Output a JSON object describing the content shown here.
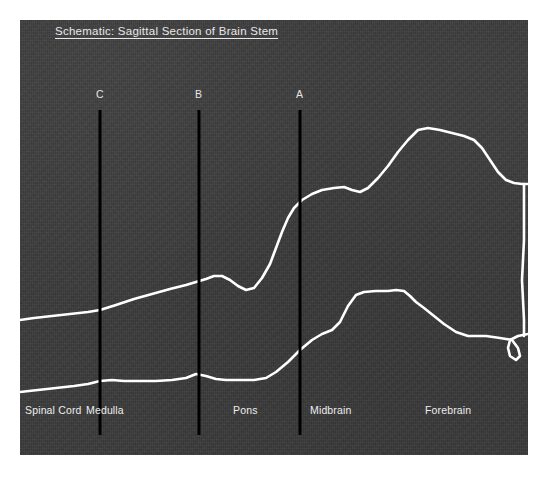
{
  "figure": {
    "title": "Schematic: Sagittal Section of Brain Stem",
    "background_color": "#ffffff",
    "plate_color": "#3b3b3b",
    "contour_color": "#ffffff",
    "marker_color": "#000000",
    "text_color": "#ededed"
  },
  "markers": [
    {
      "id": "marker-c",
      "label": "C",
      "x": 100,
      "label_x": 96,
      "label_y": 88,
      "y_top": 110,
      "y_bottom": 435
    },
    {
      "id": "marker-b",
      "label": "B",
      "x": 199,
      "label_x": 195,
      "label_y": 88,
      "y_top": 110,
      "y_bottom": 435
    },
    {
      "id": "marker-a",
      "label": "A",
      "x": 300,
      "label_x": 296,
      "label_y": 88,
      "y_top": 110,
      "y_bottom": 435
    }
  ],
  "region_labels": [
    {
      "id": "label-spinal-cord",
      "label": "Spinal Cord",
      "x": 25,
      "y": 404
    },
    {
      "id": "label-medulla",
      "label": "Medulla",
      "x": 86,
      "y": 404
    },
    {
      "id": "label-pons",
      "label": "Pons",
      "x": 233,
      "y": 404
    },
    {
      "id": "label-midbrain",
      "label": "Midbrain",
      "x": 310,
      "y": 404
    },
    {
      "id": "label-forebrain",
      "label": "Forebrain",
      "x": 425,
      "y": 404
    }
  ],
  "chart_data": {
    "type": "line",
    "title": "Schematic: Sagittal Section of Brain Stem",
    "xlabel": "",
    "ylabel": "",
    "grid": false,
    "legend": "none",
    "xlim": [
      20,
      528
    ],
    "ylim": [
      20,
      455
    ],
    "note": "Two white outline traces of a sagittal brain-stem profile drawn on a dark plate; y increases downward in screen pixels.",
    "series": [
      {
        "name": "dorsal-contour",
        "color": "#ffffff",
        "points": [
          [
            20,
            320
          ],
          [
            34,
            318
          ],
          [
            52,
            316
          ],
          [
            70,
            314
          ],
          [
            88,
            312
          ],
          [
            100,
            310
          ],
          [
            116,
            305
          ],
          [
            134,
            299
          ],
          [
            152,
            294
          ],
          [
            170,
            289
          ],
          [
            186,
            285
          ],
          [
            196,
            282
          ],
          [
            206,
            279
          ],
          [
            214,
            276
          ],
          [
            222,
            276
          ],
          [
            230,
            280
          ],
          [
            238,
            286
          ],
          [
            246,
            290
          ],
          [
            254,
            288
          ],
          [
            262,
            278
          ],
          [
            270,
            264
          ],
          [
            276,
            248
          ],
          [
            282,
            232
          ],
          [
            288,
            218
          ],
          [
            294,
            208
          ],
          [
            302,
            200
          ],
          [
            312,
            194
          ],
          [
            322,
            190
          ],
          [
            334,
            188
          ],
          [
            344,
            187
          ],
          [
            352,
            190
          ],
          [
            360,
            192
          ],
          [
            368,
            188
          ],
          [
            378,
            178
          ],
          [
            388,
            166
          ],
          [
            398,
            152
          ],
          [
            408,
            140
          ],
          [
            418,
            130
          ],
          [
            428,
            128
          ],
          [
            440,
            130
          ],
          [
            452,
            133
          ],
          [
            464,
            136
          ],
          [
            474,
            140
          ],
          [
            482,
            148
          ],
          [
            490,
            160
          ],
          [
            498,
            172
          ],
          [
            506,
            180
          ],
          [
            514,
            183
          ],
          [
            522,
            184
          ],
          [
            528,
            184
          ]
        ]
      },
      {
        "name": "ventral-contour",
        "color": "#ffffff",
        "points": [
          [
            20,
            392
          ],
          [
            38,
            390
          ],
          [
            56,
            388
          ],
          [
            74,
            386
          ],
          [
            88,
            384
          ],
          [
            100,
            381
          ],
          [
            112,
            380
          ],
          [
            124,
            381
          ],
          [
            140,
            381
          ],
          [
            156,
            381
          ],
          [
            172,
            380
          ],
          [
            186,
            378
          ],
          [
            196,
            374
          ],
          [
            206,
            376
          ],
          [
            216,
            379
          ],
          [
            226,
            380
          ],
          [
            240,
            380
          ],
          [
            254,
            380
          ],
          [
            266,
            378
          ],
          [
            276,
            372
          ],
          [
            288,
            362
          ],
          [
            300,
            350
          ],
          [
            312,
            340
          ],
          [
            322,
            334
          ],
          [
            332,
            330
          ],
          [
            340,
            322
          ],
          [
            348,
            306
          ],
          [
            356,
            295
          ],
          [
            364,
            292
          ],
          [
            376,
            291
          ],
          [
            388,
            291
          ],
          [
            396,
            290
          ],
          [
            404,
            291
          ],
          [
            410,
            296
          ],
          [
            416,
            302
          ],
          [
            424,
            308
          ],
          [
            434,
            316
          ],
          [
            444,
            324
          ],
          [
            456,
            332
          ],
          [
            468,
            336
          ],
          [
            486,
            336
          ],
          [
            500,
            338
          ],
          [
            512,
            340
          ],
          [
            518,
            348
          ],
          [
            520,
            356
          ],
          [
            516,
            360
          ],
          [
            510,
            356
          ],
          [
            508,
            348
          ],
          [
            510,
            340
          ],
          [
            518,
            336
          ],
          [
            528,
            334
          ]
        ]
      },
      {
        "name": "right-edge-connector",
        "color": "#ffffff",
        "points": [
          [
            524,
            184
          ],
          [
            524,
            240
          ],
          [
            522,
            280
          ],
          [
            524,
            320
          ],
          [
            524,
            336
          ]
        ]
      }
    ]
  }
}
